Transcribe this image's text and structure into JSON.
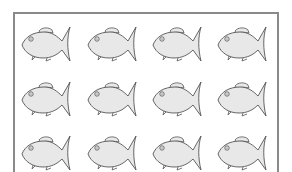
{
  "worksheet": {
    "grid": {
      "rows": 3,
      "columns": 4
    },
    "fish_fill": "#e8e8e8",
    "fish_stroke": "#555555",
    "frame_color": "#8a8a8a",
    "fish": [
      {
        "row": 1,
        "col": 1
      },
      {
        "row": 1,
        "col": 2
      },
      {
        "row": 1,
        "col": 3
      },
      {
        "row": 1,
        "col": 4
      },
      {
        "row": 2,
        "col": 1
      },
      {
        "row": 2,
        "col": 2
      },
      {
        "row": 2,
        "col": 3
      },
      {
        "row": 2,
        "col": 4
      },
      {
        "row": 3,
        "col": 1
      },
      {
        "row": 3,
        "col": 2
      },
      {
        "row": 3,
        "col": 3
      },
      {
        "row": 3,
        "col": 4
      }
    ]
  }
}
